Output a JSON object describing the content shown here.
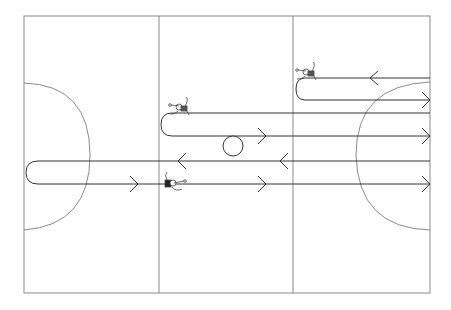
{
  "diagram": {
    "type": "handball-drill",
    "court": {
      "x": 24,
      "y": 16,
      "width": 406,
      "height": 277,
      "line_color": "#8a8a8a"
    },
    "dividers_x": [
      159,
      293
    ],
    "goal_areas": [
      {
        "side": "left",
        "center_x": 24,
        "center_y": 155,
        "radius": 70
      },
      {
        "side": "right",
        "center_x": 430,
        "center_y": 155,
        "radius": 70
      }
    ],
    "ball": {
      "cx": 233,
      "cy": 146,
      "r": 10
    },
    "paths": [
      {
        "name": "top-loop",
        "upper_y": 78,
        "lower_y": 100,
        "turn_x": 305,
        "end_x": 430,
        "upper_dir": "left",
        "lower_dir": "right"
      },
      {
        "name": "mid-loop",
        "upper_y": 113,
        "lower_y": 136,
        "turn_x": 172,
        "end_x": 430,
        "upper_dir": "left",
        "lower_dir": "right"
      },
      {
        "name": "bottom-loop",
        "upper_y": 161,
        "lower_y": 184,
        "turn_x": 36,
        "end_x": 430,
        "upper_dir": "left",
        "lower_dir": "right"
      }
    ],
    "arrows": [
      {
        "x": 370,
        "y": 78,
        "dir": "left"
      },
      {
        "x": 425,
        "y": 100,
        "dir": "right"
      },
      {
        "x": 425,
        "y": 113,
        "dir": "right"
      },
      {
        "x": 265,
        "y": 136,
        "dir": "right"
      },
      {
        "x": 425,
        "y": 136,
        "dir": "right"
      },
      {
        "x": 178,
        "y": 161,
        "dir": "left"
      },
      {
        "x": 280,
        "y": 161,
        "dir": "left"
      },
      {
        "x": 138,
        "y": 184,
        "dir": "right"
      },
      {
        "x": 265,
        "y": 184,
        "dir": "right"
      },
      {
        "x": 425,
        "y": 184,
        "dir": "right"
      }
    ],
    "players": [
      {
        "name": "player-top",
        "x": 310,
        "y": 75
      },
      {
        "name": "player-mid",
        "x": 180,
        "y": 108
      },
      {
        "name": "player-bottom",
        "x": 170,
        "y": 183
      }
    ],
    "line_color": "#333333"
  }
}
